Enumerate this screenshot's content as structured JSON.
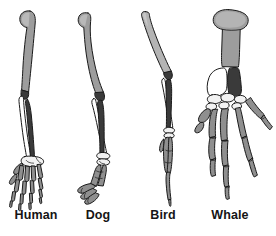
{
  "figure": {
    "background_color": "#ffffff",
    "outline_color": "#1a1a1a"
  },
  "palette": {
    "humerus": "#9d9d9d",
    "humerus_light": "#b4b4b4",
    "radius": "#ffffff",
    "ulna": "#3a3a3a",
    "carpals": "#f2f2f2",
    "digits": "#8f8f8f",
    "outline": "#1a1a1a",
    "label_text": "#151515"
  },
  "bone_legend": {
    "humerus": "humerus",
    "radius": "radius",
    "ulna": "ulna",
    "carpals": "carpals",
    "metacarpals": "metacarpals",
    "phalanges": "phalanges"
  },
  "specimens": [
    {
      "id": "human",
      "label": "Human",
      "label_x": 36,
      "limb_type": "arm",
      "digit_count": 5
    },
    {
      "id": "dog",
      "label": "Dog",
      "label_x": 98,
      "limb_type": "foreleg",
      "digit_count": 4
    },
    {
      "id": "bird",
      "label": "Bird",
      "label_x": 163,
      "limb_type": "wing",
      "digit_count": 3
    },
    {
      "id": "whale",
      "label": "Whale",
      "label_x": 230,
      "limb_type": "flipper",
      "digit_count": 5
    }
  ]
}
